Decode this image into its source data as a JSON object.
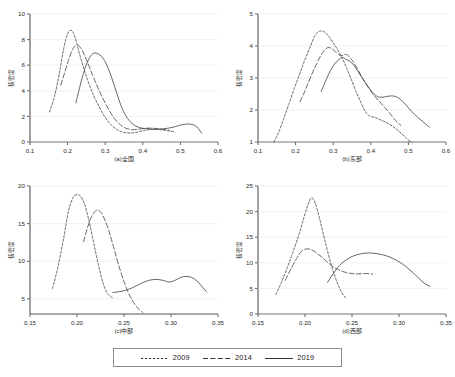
{
  "figure": {
    "title": "",
    "panel_count": 4
  },
  "legend": {
    "position": "bottom-center",
    "entries": [
      {
        "label": "2009",
        "style": "short-dash",
        "dasharray": "2.2 1.8"
      },
      {
        "label": "2014",
        "style": "long-dash",
        "dasharray": "5 2.4"
      },
      {
        "label": "2019",
        "style": "solid",
        "dasharray": "none"
      }
    ]
  },
  "chart_data": [
    {
      "type": "line",
      "id": "panel-a",
      "title": "(a)全国",
      "xlabel": "(a)全国",
      "ylabel": "核密度",
      "xlim": [
        0.1,
        0.6
      ],
      "ylim": [
        0,
        10
      ],
      "xticks": [
        "0.1",
        "0.2",
        "0.3",
        "0.4",
        "0.5",
        "0.6"
      ],
      "xtick_values": [
        0.1,
        0.2,
        0.3,
        0.4,
        0.5,
        0.6
      ],
      "yticks": [
        "0",
        "2",
        "4",
        "6",
        "8",
        "10"
      ],
      "ytick_values": [
        0,
        2,
        4,
        6,
        8,
        10
      ],
      "grid": false,
      "series": [
        {
          "name": "2009",
          "x": [
            0.152,
            0.165,
            0.178,
            0.19,
            0.2,
            0.208,
            0.215,
            0.223,
            0.232,
            0.242,
            0.252,
            0.262,
            0.272,
            0.284,
            0.296,
            0.308,
            0.32,
            0.332,
            0.344,
            0.356,
            0.368,
            0.38,
            0.392,
            0.404,
            0.416,
            0.43,
            0.444,
            0.458,
            0.472,
            0.486
          ],
          "y": [
            2.35,
            3.55,
            5.35,
            7.35,
            8.45,
            8.72,
            8.55,
            7.85,
            6.85,
            5.85,
            4.95,
            4.15,
            3.45,
            2.75,
            2.1,
            1.6,
            1.22,
            0.96,
            0.8,
            0.72,
            0.7,
            0.74,
            0.82,
            0.9,
            0.96,
            0.98,
            0.96,
            0.92,
            0.86,
            0.8
          ]
        },
        {
          "name": "2014",
          "x": [
            0.182,
            0.192,
            0.202,
            0.212,
            0.22,
            0.228,
            0.236,
            0.244,
            0.254,
            0.264,
            0.276,
            0.288,
            0.3,
            0.312,
            0.324,
            0.336,
            0.348,
            0.36,
            0.372,
            0.384,
            0.398,
            0.412,
            0.426,
            0.44,
            0.456,
            0.47
          ],
          "y": [
            4.45,
            5.4,
            6.35,
            7.15,
            7.5,
            7.55,
            7.3,
            6.85,
            6.15,
            5.4,
            4.55,
            3.75,
            3.05,
            2.4,
            1.85,
            1.45,
            1.18,
            1.02,
            0.96,
            0.98,
            1.04,
            1.08,
            1.08,
            1.04,
            0.98,
            0.92
          ]
        },
        {
          "name": "2019",
          "x": [
            0.222,
            0.232,
            0.242,
            0.252,
            0.262,
            0.27,
            0.278,
            0.286,
            0.294,
            0.302,
            0.312,
            0.322,
            0.332,
            0.342,
            0.354,
            0.366,
            0.378,
            0.392,
            0.406,
            0.42,
            0.436,
            0.452,
            0.468,
            0.484,
            0.5,
            0.516,
            0.53,
            0.544,
            0.556
          ],
          "y": [
            3.05,
            4.25,
            5.35,
            6.2,
            6.75,
            6.95,
            6.92,
            6.8,
            6.55,
            6.15,
            5.45,
            4.6,
            3.7,
            2.85,
            2.1,
            1.6,
            1.3,
            1.12,
            1.05,
            1.02,
            1.0,
            1.02,
            1.08,
            1.18,
            1.32,
            1.4,
            1.38,
            1.18,
            0.7
          ]
        }
      ]
    },
    {
      "type": "line",
      "id": "panel-b",
      "title": "(b)东部",
      "xlabel": "(b)东部",
      "ylabel": "核密度",
      "xlim": [
        0.1,
        0.6
      ],
      "ylim": [
        1,
        5
      ],
      "xticks": [
        "0.1",
        "0.2",
        "0.3",
        "0.4",
        "0.5",
        "0.6"
      ],
      "xtick_values": [
        0.1,
        0.2,
        0.3,
        0.4,
        0.5,
        0.6
      ],
      "yticks": [
        "1",
        "2",
        "3",
        "4",
        "5"
      ],
      "ytick_values": [
        1,
        2,
        3,
        4,
        5
      ],
      "grid": false,
      "series": [
        {
          "name": "2009",
          "x": [
            0.142,
            0.155,
            0.168,
            0.182,
            0.196,
            0.21,
            0.224,
            0.238,
            0.252,
            0.264,
            0.276,
            0.288,
            0.3,
            0.312,
            0.324,
            0.336,
            0.348,
            0.36,
            0.372,
            0.384,
            0.396,
            0.412,
            0.428,
            0.446,
            0.464,
            0.482,
            0.498,
            0.51
          ],
          "y": [
            1.0,
            1.3,
            1.72,
            2.18,
            2.66,
            3.1,
            3.55,
            3.95,
            4.34,
            4.46,
            4.44,
            4.3,
            4.1,
            3.88,
            3.62,
            3.3,
            2.96,
            2.6,
            2.28,
            1.98,
            1.82,
            1.76,
            1.68,
            1.58,
            1.44,
            1.26,
            1.08,
            0.98
          ]
        },
        {
          "name": "2014",
          "x": [
            0.212,
            0.222,
            0.232,
            0.244,
            0.256,
            0.266,
            0.276,
            0.286,
            0.296,
            0.306,
            0.316,
            0.324,
            0.332,
            0.34,
            0.35,
            0.362,
            0.374,
            0.386,
            0.398,
            0.41,
            0.422,
            0.434,
            0.446,
            0.458,
            0.47,
            0.48
          ],
          "y": [
            2.26,
            2.52,
            2.8,
            3.14,
            3.45,
            3.68,
            3.86,
            3.95,
            3.92,
            3.82,
            3.72,
            3.7,
            3.74,
            3.7,
            3.56,
            3.34,
            3.08,
            2.84,
            2.62,
            2.44,
            2.28,
            2.12,
            1.96,
            1.78,
            1.62,
            1.52
          ]
        },
        {
          "name": "2019",
          "x": [
            0.268,
            0.278,
            0.288,
            0.298,
            0.308,
            0.318,
            0.326,
            0.334,
            0.342,
            0.352,
            0.364,
            0.376,
            0.39,
            0.404,
            0.418,
            0.43,
            0.442,
            0.454,
            0.466,
            0.478,
            0.492,
            0.508,
            0.524,
            0.54,
            0.556
          ],
          "y": [
            2.58,
            2.86,
            3.12,
            3.34,
            3.5,
            3.6,
            3.64,
            3.58,
            3.54,
            3.44,
            3.24,
            3.02,
            2.78,
            2.56,
            2.42,
            2.4,
            2.42,
            2.44,
            2.42,
            2.34,
            2.18,
            1.96,
            1.78,
            1.62,
            1.46
          ]
        }
      ]
    },
    {
      "type": "line",
      "id": "panel-c",
      "title": "(c)中部",
      "xlabel": "(c)中部",
      "ylabel": "核密度",
      "xlim": [
        0.15,
        0.35
      ],
      "ylim": [
        3,
        20
      ],
      "xticks": [
        "0.15",
        "0.20",
        "0.25",
        "0.30",
        "0.35"
      ],
      "xtick_values": [
        0.15,
        0.2,
        0.25,
        0.3,
        0.35
      ],
      "yticks": [
        "5",
        "10",
        "15",
        "20"
      ],
      "ytick_values": [
        5,
        10,
        15,
        20
      ],
      "grid": false,
      "series": [
        {
          "name": "2009",
          "x": [
            0.174,
            0.18,
            0.186,
            0.191,
            0.196,
            0.2,
            0.204,
            0.208,
            0.212,
            0.216,
            0.22,
            0.224,
            0.228,
            0.232,
            0.236,
            0.238
          ],
          "y": [
            6.4,
            9.4,
            13.2,
            16.7,
            18.5,
            18.85,
            18.6,
            17.6,
            15.8,
            13.5,
            11.1,
            8.9,
            7.0,
            5.8,
            5.35,
            5.1
          ]
        },
        {
          "name": "2014",
          "x": [
            0.207,
            0.211,
            0.215,
            0.219,
            0.222,
            0.226,
            0.23,
            0.234,
            0.238,
            0.242,
            0.246,
            0.25,
            0.254,
            0.258,
            0.262,
            0.266,
            0.27
          ],
          "y": [
            12.6,
            14.4,
            15.8,
            16.6,
            16.8,
            16.4,
            15.4,
            14.0,
            12.3,
            10.5,
            8.8,
            7.3,
            6.0,
            5.0,
            4.2,
            3.6,
            3.2
          ]
        },
        {
          "name": "2019",
          "x": [
            0.238,
            0.244,
            0.252,
            0.26,
            0.268,
            0.276,
            0.284,
            0.292,
            0.298,
            0.304,
            0.31,
            0.316,
            0.322,
            0.328,
            0.334,
            0.338
          ],
          "y": [
            5.85,
            5.95,
            6.15,
            6.55,
            7.05,
            7.45,
            7.6,
            7.45,
            7.25,
            7.45,
            7.85,
            8.0,
            7.85,
            7.35,
            6.5,
            5.9
          ]
        }
      ]
    },
    {
      "type": "line",
      "id": "panel-d",
      "title": "(d)西部",
      "xlabel": "(d)西部",
      "ylabel": "核密度",
      "xlim": [
        0.15,
        0.35
      ],
      "ylim": [
        0,
        25
      ],
      "xticks": [
        "0.15",
        "0.20",
        "0.25",
        "0.30",
        "0.35"
      ],
      "xtick_values": [
        0.15,
        0.2,
        0.25,
        0.3,
        0.35
      ],
      "yticks": [
        "0",
        "5",
        "10",
        "15",
        "20",
        "25"
      ],
      "ytick_values": [
        0,
        5,
        10,
        15,
        20,
        25
      ],
      "grid": false,
      "series": [
        {
          "name": "2009",
          "x": [
            0.169,
            0.175,
            0.181,
            0.187,
            0.193,
            0.198,
            0.203,
            0.207,
            0.211,
            0.215,
            0.219,
            0.223,
            0.227,
            0.231,
            0.235,
            0.239,
            0.243
          ],
          "y": [
            3.8,
            6.2,
            9.0,
            12.0,
            15.2,
            18.3,
            21.2,
            22.7,
            21.6,
            19.0,
            16.0,
            13.0,
            10.2,
            7.8,
            5.8,
            4.2,
            3.2
          ]
        },
        {
          "name": "2014",
          "x": [
            0.179,
            0.185,
            0.191,
            0.196,
            0.201,
            0.206,
            0.211,
            0.216,
            0.221,
            0.226,
            0.231,
            0.236,
            0.242,
            0.248,
            0.254,
            0.26,
            0.266,
            0.272
          ],
          "y": [
            6.6,
            8.8,
            10.8,
            12.2,
            12.7,
            12.6,
            12.1,
            11.4,
            10.6,
            9.8,
            9.1,
            8.6,
            8.2,
            7.95,
            7.85,
            7.85,
            7.9,
            7.8
          ]
        },
        {
          "name": "2019",
          "x": [
            0.224,
            0.229,
            0.234,
            0.239,
            0.245,
            0.251,
            0.258,
            0.265,
            0.272,
            0.279,
            0.286,
            0.293,
            0.3,
            0.307,
            0.314,
            0.321,
            0.327,
            0.333
          ],
          "y": [
            6.2,
            7.6,
            8.9,
            9.9,
            10.7,
            11.3,
            11.7,
            11.9,
            11.9,
            11.7,
            11.4,
            10.9,
            10.2,
            9.3,
            8.2,
            7.0,
            6.0,
            5.4
          ]
        }
      ]
    }
  ]
}
